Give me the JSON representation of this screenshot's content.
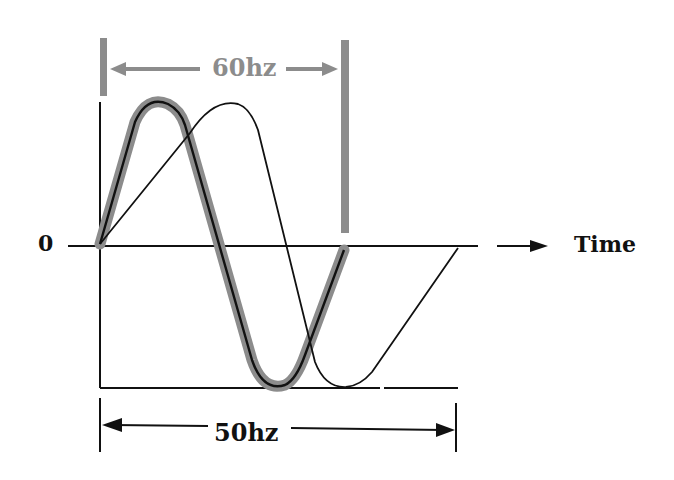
{
  "diagram": {
    "title": "",
    "labels": {
      "zero": "0",
      "time": "Time",
      "freq_60": "60hz",
      "freq_50": "50hz"
    },
    "colors": {
      "line": "#111111",
      "highlight_60hz": "#8c8c8c",
      "background": "#ffffff"
    },
    "waves": [
      {
        "name": "60hz",
        "style": "thick gray highlight with black center line",
        "cycles": 1,
        "start_x": 100,
        "end_x": 345
      },
      {
        "name": "50hz",
        "style": "thin black line",
        "cycles": 1,
        "start_x": 100,
        "end_x": 457
      }
    ]
  }
}
